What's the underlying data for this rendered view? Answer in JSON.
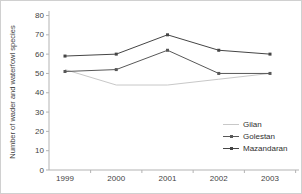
{
  "chart_data": {
    "type": "line",
    "title": "",
    "xlabel": "",
    "ylabel": "Number of wader and waterfowl species",
    "ylim": [
      0,
      80
    ],
    "yticks": [
      0,
      10,
      20,
      30,
      40,
      50,
      60,
      70,
      80
    ],
    "categories": [
      "1999",
      "2000",
      "2001",
      "2002",
      "2003"
    ],
    "grid": false,
    "legend_position": "right-center",
    "axis_color": "#b3b3b3",
    "text_color": "#3f3f3f",
    "series": [
      {
        "name": "Gilan",
        "values": [
          52,
          44,
          44,
          47,
          50
        ],
        "color": "#c8c8c8",
        "marker": false
      },
      {
        "name": "Golestan",
        "values": [
          51,
          52,
          62,
          50,
          50
        ],
        "color": "#585858",
        "marker": true
      },
      {
        "name": "Mazandaran",
        "values": [
          59,
          60,
          70,
          62,
          60
        ],
        "color": "#454545",
        "marker": true
      }
    ]
  }
}
